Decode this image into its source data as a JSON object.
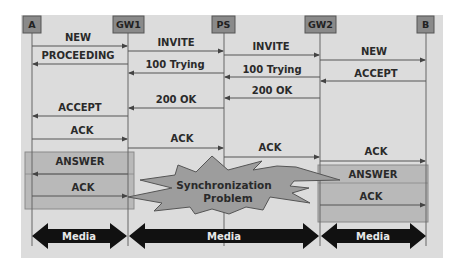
{
  "diagram": {
    "title": "",
    "colors": {
      "panel": "#dcdcdc",
      "header_box": "#8a8a8a",
      "lifeline": "#666666",
      "arrow": "#555555",
      "highlight_box": "#b9b9b9",
      "starburst": "#9d9d9d",
      "media_arrow": "#111111"
    },
    "participants": [
      {
        "id": "A",
        "label": "A"
      },
      {
        "id": "GW1",
        "label": "GW1"
      },
      {
        "id": "PS",
        "label": "PS"
      },
      {
        "id": "GW2",
        "label": "GW2"
      },
      {
        "id": "B",
        "label": "B"
      }
    ],
    "messages": [
      {
        "from": "A",
        "to": "GW1",
        "label": "NEW"
      },
      {
        "from": "GW1",
        "to": "PS",
        "label": "INVITE"
      },
      {
        "from": "GW1",
        "to": "A",
        "label": "PROCEEDING"
      },
      {
        "from": "PS",
        "to": "GW2",
        "label": "INVITE"
      },
      {
        "from": "GW2",
        "to": "B",
        "label": "NEW"
      },
      {
        "from": "PS",
        "to": "GW1",
        "label": "100 Trying"
      },
      {
        "from": "GW2",
        "to": "PS",
        "label": "100 Trying"
      },
      {
        "from": "B",
        "to": "GW2",
        "label": "ACCEPT"
      },
      {
        "from": "GW2",
        "to": "PS",
        "label": "200 OK"
      },
      {
        "from": "PS",
        "to": "GW1",
        "label": "200 OK"
      },
      {
        "from": "GW1",
        "to": "A",
        "label": "ACCEPT"
      },
      {
        "from": "A",
        "to": "GW1",
        "label": "ACK"
      },
      {
        "from": "GW1",
        "to": "PS",
        "label": "ACK"
      },
      {
        "from": "PS",
        "to": "GW2",
        "label": "ACK"
      },
      {
        "from": "GW2",
        "to": "B",
        "label": "ACK"
      }
    ],
    "left_box": {
      "messages": [
        {
          "from": "GW1",
          "to": "A",
          "label": "ANSWER"
        },
        {
          "from": "A",
          "to": "GW1",
          "label": "ACK"
        }
      ]
    },
    "right_box": {
      "messages": [
        {
          "from": "B",
          "to": "GW2",
          "label": "ANSWER"
        },
        {
          "from": "GW2",
          "to": "B",
          "label": "ACK"
        }
      ]
    },
    "callout": {
      "line1": "Synchronization",
      "line2": "Problem"
    },
    "media": [
      {
        "from": "A",
        "to": "GW1",
        "label": "Media"
      },
      {
        "from": "GW1",
        "to": "GW2",
        "label": "Media"
      },
      {
        "from": "GW2",
        "to": "B",
        "label": "Media"
      }
    ]
  }
}
